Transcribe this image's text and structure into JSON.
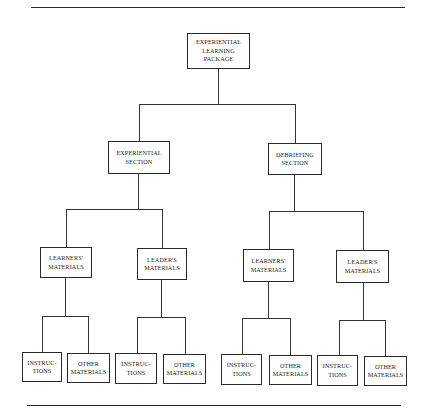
{
  "diagram": {
    "type": "tree",
    "root": {
      "lines": [
        "EXPERIENTIAL",
        "LEARNING",
        "PACKAGE"
      ]
    },
    "sections": [
      {
        "lines": [
          "EXPERIENTIAL",
          "SECTION"
        ],
        "children": [
          {
            "lines": [
              "LEARNERS'",
              "MATERIALS"
            ],
            "children": [
              {
                "lines": [
                  "INSTRUC-",
                  "TIONS"
                ]
              },
              {
                "lines": [
                  "OTHER",
                  "MATERIALS"
                ]
              }
            ]
          },
          {
            "lines": [
              "LEADER'S",
              "MATERIALS"
            ],
            "children": [
              {
                "lines": [
                  "INSTRUC-",
                  "TIONS"
                ]
              },
              {
                "lines": [
                  "OTHER",
                  "MATERIALS"
                ]
              }
            ]
          }
        ]
      },
      {
        "lines": [
          "DEBRIEFING",
          "SECTION"
        ],
        "children": [
          {
            "lines": [
              "LEARNERS'",
              "MATERIALS"
            ],
            "children": [
              {
                "lines": [
                  "INSTRUC-",
                  "TIONS"
                ]
              },
              {
                "lines": [
                  "OTHER",
                  "MATERIALS"
                ]
              }
            ]
          },
          {
            "lines": [
              "LEADER'S",
              "MATERIALS"
            ],
            "children": [
              {
                "lines": [
                  "INSTRUC-",
                  "TIONS"
                ]
              },
              {
                "lines": [
                  "OTHER",
                  "MATERIALS"
                ]
              }
            ]
          }
        ]
      }
    ]
  }
}
